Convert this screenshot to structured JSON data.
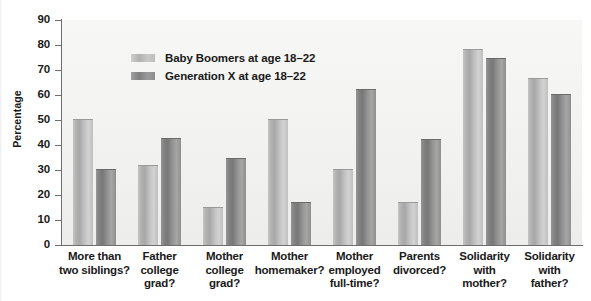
{
  "chart_data": {
    "type": "bar",
    "title": "",
    "xlabel": "",
    "ylabel": "Percentage",
    "ylim": [
      0,
      90
    ],
    "ytick_step": 10,
    "yticks": [
      0,
      10,
      20,
      30,
      40,
      50,
      60,
      70,
      80,
      90
    ],
    "grid": false,
    "legend_position": "upper-left-inside",
    "categories": [
      "More than\ntwo siblings?",
      "Father\ncollege\ngrad?",
      "Mother\ncollege\ngrad?",
      "Mother\nhomemaker?",
      "Mother\nemployed\nfull-time?",
      "Parents\ndivorced?",
      "Solidarity\nwith\nmother?",
      "Solidarity\nwith\nfather?"
    ],
    "category_lines": [
      [
        "More than",
        "two siblings?"
      ],
      [
        "Father",
        "college",
        "grad?"
      ],
      [
        "Mother",
        "college",
        "grad?"
      ],
      [
        "Mother",
        "homemaker?"
      ],
      [
        "Mother",
        "employed",
        "full-time?"
      ],
      [
        "Parents",
        "divorced?"
      ],
      [
        "Solidarity",
        "with",
        "mother?"
      ],
      [
        "Solidarity",
        "with",
        "father?"
      ]
    ],
    "series": [
      {
        "name": "Baby Boomers at age 18–22",
        "color": "#bdbdbd",
        "values": [
          50,
          31.5,
          15,
          50,
          30,
          17,
          78,
          66.5
        ]
      },
      {
        "name": "Generation X at age 18–22",
        "color": "#8d8d8d",
        "values": [
          30,
          42.5,
          34.5,
          17,
          62,
          42,
          74.5,
          60
        ]
      }
    ]
  },
  "legend": {
    "items": [
      {
        "label": "Baby Boomers at age 18–22",
        "swatch": "light-gray-swatch"
      },
      {
        "label": "Generation X at age 18–22",
        "swatch": "dark-gray-swatch"
      }
    ]
  },
  "axes": {
    "y_title": "Percentage",
    "y_tick_labels": [
      "90",
      "80",
      "70",
      "60",
      "50",
      "40",
      "30",
      "20",
      "10",
      "0"
    ]
  }
}
